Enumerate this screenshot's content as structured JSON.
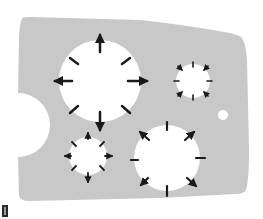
{
  "diagram": {
    "colors": {
      "plate": "#c8c8c8",
      "hole": "#ffffff",
      "arrow": "#1a1a1a",
      "background": "#ffffff"
    },
    "plate": {
      "notch": {
        "cx": 18,
        "cy": 125,
        "r": 30
      }
    },
    "holes": [
      {
        "id": "large-hole",
        "cx": 100,
        "cy": 81,
        "r": 41,
        "arrows": 8,
        "arrow_direction": "outward"
      },
      {
        "id": "small-top-right-hole",
        "cx": 193,
        "cy": 81,
        "r": 17,
        "arrows": 8,
        "arrow_direction": "mixed"
      },
      {
        "id": "small-bottom-left-hole",
        "cx": 88,
        "cy": 156,
        "r": 19,
        "arrows": 8,
        "arrow_direction": "outward"
      },
      {
        "id": "medium-bottom-right-hole",
        "cx": 167,
        "cy": 158,
        "r": 33,
        "arrows": 8,
        "arrow_direction": "mixed"
      }
    ],
    "dot": {
      "cx": 223,
      "cy": 115,
      "r": 5
    }
  }
}
